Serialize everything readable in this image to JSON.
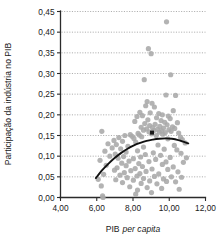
{
  "chart_data": {
    "type": "scatter",
    "title": "",
    "xlabel": "PIB per capita",
    "xlabel_plain": "PIB",
    "xlabel_italic": "per capita",
    "ylabel": "Participação da indústria no PIB",
    "xlim": [
      4.0,
      12.0
    ],
    "ylim": [
      0.0,
      0.45
    ],
    "xticks": [
      4.0,
      6.0,
      8.0,
      10.0,
      12.0
    ],
    "xtick_labels": [
      "4,00",
      "6,00",
      "8,00",
      "10,00",
      "12,00"
    ],
    "yticks": [
      0.0,
      0.05,
      0.1,
      0.15,
      0.2,
      0.25,
      0.3,
      0.35,
      0.4,
      0.45
    ],
    "ytick_labels": [
      "0,00",
      "0,05",
      "0,10",
      "0,15",
      "0,20",
      "0,25",
      "0,30",
      "0,35",
      "0,40",
      "0,45"
    ],
    "grid": "horizontal-dotted",
    "legend": "none",
    "decimal_separator": ",",
    "point_color": "#a8a8a8",
    "trend_color": "#111111",
    "grid_color": "#9a9a9a",
    "axis_color": "#2b2b2b",
    "series": [
      {
        "name": "Países",
        "marker": "circle",
        "points": [
          [
            9.85,
            0.425
          ],
          [
            8.85,
            0.36
          ],
          [
            9.0,
            0.348
          ],
          [
            10.08,
            0.297
          ],
          [
            8.62,
            0.285
          ],
          [
            9.82,
            0.248
          ],
          [
            10.35,
            0.247
          ],
          [
            8.78,
            0.232
          ],
          [
            9.05,
            0.228
          ],
          [
            8.7,
            0.222
          ],
          [
            9.18,
            0.219
          ],
          [
            10.22,
            0.21
          ],
          [
            8.38,
            0.206
          ],
          [
            8.95,
            0.205
          ],
          [
            9.42,
            0.203
          ],
          [
            9.62,
            0.2
          ],
          [
            8.52,
            0.198
          ],
          [
            9.95,
            0.197
          ],
          [
            8.22,
            0.196
          ],
          [
            9.3,
            0.193
          ],
          [
            10.05,
            0.191
          ],
          [
            8.82,
            0.188
          ],
          [
            9.55,
            0.186
          ],
          [
            8.1,
            0.184
          ],
          [
            9.75,
            0.182
          ],
          [
            10.45,
            0.181
          ],
          [
            8.65,
            0.179
          ],
          [
            9.22,
            0.177
          ],
          [
            9.88,
            0.176
          ],
          [
            8.92,
            0.174
          ],
          [
            9.48,
            0.172
          ],
          [
            10.18,
            0.171
          ],
          [
            8.45,
            0.17
          ],
          [
            9.08,
            0.169
          ],
          [
            9.68,
            0.168
          ],
          [
            10.3,
            0.167
          ],
          [
            8.75,
            0.166
          ],
          [
            9.35,
            0.165
          ],
          [
            9.98,
            0.164
          ],
          [
            8.58,
            0.163
          ],
          [
            9.15,
            0.162
          ],
          [
            9.58,
            0.161
          ],
          [
            10.1,
            0.16
          ],
          [
            8.88,
            0.159
          ],
          [
            9.45,
            0.158
          ],
          [
            9.78,
            0.157
          ],
          [
            10.52,
            0.156
          ],
          [
            8.28,
            0.155
          ],
          [
            9.02,
            0.154
          ],
          [
            9.65,
            0.153
          ],
          [
            7.85,
            0.152
          ],
          [
            8.35,
            0.151
          ],
          [
            9.28,
            0.15
          ],
          [
            6.28,
            0.16
          ],
          [
            7.55,
            0.15
          ],
          [
            7.95,
            0.148
          ],
          [
            8.48,
            0.147
          ],
          [
            10.62,
            0.146
          ],
          [
            7.22,
            0.145
          ],
          [
            8.05,
            0.143
          ],
          [
            9.92,
            0.142
          ],
          [
            10.72,
            0.14
          ],
          [
            6.95,
            0.138
          ],
          [
            7.42,
            0.136
          ],
          [
            8.15,
            0.134
          ],
          [
            10.88,
            0.132
          ],
          [
            6.62,
            0.13
          ],
          [
            7.08,
            0.128
          ],
          [
            9.38,
            0.127
          ],
          [
            10.28,
            0.126
          ],
          [
            7.72,
            0.124
          ],
          [
            8.58,
            0.122
          ],
          [
            6.85,
            0.12
          ],
          [
            7.32,
            0.118
          ],
          [
            9.72,
            0.117
          ],
          [
            10.42,
            0.115
          ],
          [
            8.25,
            0.113
          ],
          [
            6.45,
            0.112
          ],
          [
            7.62,
            0.11
          ],
          [
            9.12,
            0.108
          ],
          [
            10.65,
            0.107
          ],
          [
            7.02,
            0.105
          ],
          [
            8.68,
            0.104
          ],
          [
            9.52,
            0.102
          ],
          [
            6.72,
            0.1
          ],
          [
            7.48,
            0.099
          ],
          [
            8.42,
            0.098
          ],
          [
            10.05,
            0.097
          ],
          [
            10.95,
            0.096
          ],
          [
            7.18,
            0.095
          ],
          [
            8.02,
            0.094
          ],
          [
            9.25,
            0.092
          ],
          [
            6.18,
            0.09
          ],
          [
            7.78,
            0.088
          ],
          [
            8.88,
            0.087
          ],
          [
            9.82,
            0.086
          ],
          [
            10.78,
            0.085
          ],
          [
            7.38,
            0.083
          ],
          [
            8.32,
            0.082
          ],
          [
            9.62,
            0.08
          ],
          [
            6.52,
            0.078
          ],
          [
            7.62,
            0.077
          ],
          [
            8.52,
            0.075
          ],
          [
            10.22,
            0.074
          ],
          [
            7.12,
            0.072
          ],
          [
            8.12,
            0.07
          ],
          [
            9.05,
            0.069
          ],
          [
            9.92,
            0.068
          ],
          [
            6.98,
            0.066
          ],
          [
            7.88,
            0.065
          ],
          [
            8.72,
            0.063
          ],
          [
            10.48,
            0.062
          ],
          [
            7.52,
            0.06
          ],
          [
            8.38,
            0.058
          ],
          [
            9.42,
            0.057
          ],
          [
            6.38,
            0.056
          ],
          [
            7.28,
            0.054
          ],
          [
            8.22,
            0.052
          ],
          [
            9.18,
            0.051
          ],
          [
            10.12,
            0.05
          ],
          [
            10.68,
            0.049
          ],
          [
            7.68,
            0.048
          ],
          [
            8.58,
            0.046
          ],
          [
            9.68,
            0.045
          ],
          [
            6.08,
            0.044
          ],
          [
            7.05,
            0.043
          ],
          [
            8.02,
            0.042
          ],
          [
            8.92,
            0.04
          ],
          [
            9.85,
            0.039
          ],
          [
            10.35,
            0.038
          ],
          [
            7.42,
            0.036
          ],
          [
            8.45,
            0.034
          ],
          [
            9.32,
            0.033
          ],
          [
            6.25,
            0.028
          ],
          [
            7.82,
            0.026
          ],
          [
            8.78,
            0.024
          ],
          [
            9.58,
            0.022
          ],
          [
            10.55,
            0.02
          ],
          [
            8.25,
            0.018
          ],
          [
            9.02,
            0.012
          ],
          [
            6.32,
            0.004
          ],
          [
            6.35,
            0.0
          ],
          [
            8.15,
            0.008
          ]
        ]
      }
    ],
    "trend": {
      "name": "Curva ajustada (quadrática)",
      "points": [
        [
          5.95,
          0.047
        ],
        [
          6.3,
          0.066
        ],
        [
          6.65,
          0.082
        ],
        [
          7.0,
          0.096
        ],
        [
          7.35,
          0.108
        ],
        [
          7.7,
          0.118
        ],
        [
          8.05,
          0.126
        ],
        [
          8.4,
          0.132
        ],
        [
          8.75,
          0.137
        ],
        [
          9.1,
          0.14
        ],
        [
          9.45,
          0.142
        ],
        [
          9.8,
          0.143
        ],
        [
          10.15,
          0.142
        ],
        [
          10.5,
          0.139
        ],
        [
          10.85,
          0.134
        ],
        [
          11.05,
          0.131
        ]
      ]
    },
    "highlight_marker": {
      "x": 9.05,
      "y": 0.157,
      "shape": "square"
    }
  }
}
